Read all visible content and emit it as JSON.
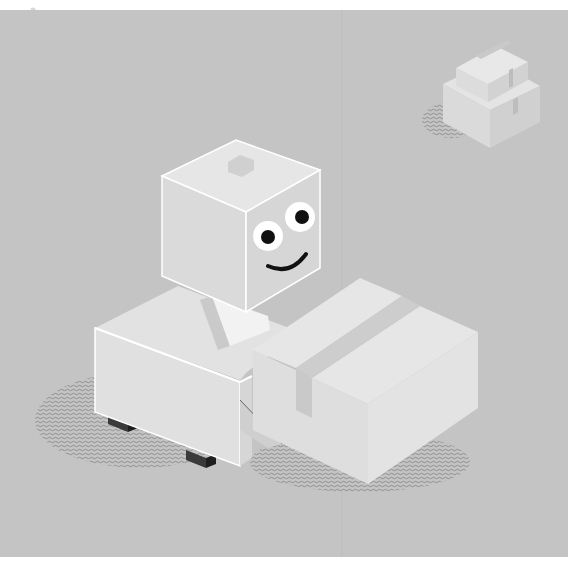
{
  "illustration": {
    "subject": "isometric cube robot pushing a cardboard box",
    "background_color": "#c4c4c4",
    "page_color": "#ffffff",
    "colors": {
      "face_top": "#e6e6e6",
      "face_left": "#dcdcdc",
      "face_right": "#d2d2d2",
      "edge_highlight": "#ffffff",
      "tape": "#c8c8c8",
      "shadow_pattern": "#8a8a8a",
      "feet": "#3a3a3a",
      "eye_white": "#ffffff",
      "pupil": "#111111",
      "smile": "#111111"
    },
    "elements": [
      "robot-head",
      "robot-eyes",
      "robot-smile",
      "robot-body",
      "robot-feet",
      "cardboard-box",
      "stacked-boxes",
      "ground-shadows"
    ]
  }
}
